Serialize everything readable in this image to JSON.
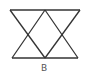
{
  "figure": {
    "label": "B",
    "stroke_color": "#333333",
    "background": "#ffffff"
  }
}
